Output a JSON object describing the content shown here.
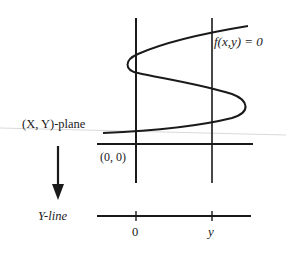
{
  "diagram": {
    "type": "projection-diagram",
    "curve_label": "f(x,y) = 0",
    "plane_label": "(X, Y)-plane",
    "origin_label": "(0, 0)",
    "line_label": "Y-line",
    "line_ticks": [
      {
        "label": "0"
      },
      {
        "label": "y"
      }
    ],
    "arrow": "projection-arrow-down",
    "colors": {
      "ink": "#1a1a1a",
      "background": "#ffffff",
      "faint_rule": "#c8c8c8"
    }
  }
}
